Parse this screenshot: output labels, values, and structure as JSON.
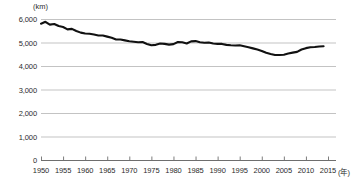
{
  "chart_data": {
    "type": "line",
    "title": "",
    "xlabel": "年",
    "ylabel": "(km)",
    "unit_label": "(km)",
    "x_unit_suffix": "(年)",
    "xlim": [
      1950,
      2015
    ],
    "ylim": [
      0,
      6000
    ],
    "grid": true,
    "grid_axis": "y",
    "legend": "none",
    "line_color": "#111111",
    "grid_color": "#b4b4b4",
    "axis_color": "#6e6e6e",
    "y_ticks": [
      "0",
      "1,000",
      "2,000",
      "3,000",
      "4,000",
      "5,000",
      "6,000"
    ],
    "y_tick_values": [
      0,
      1000,
      2000,
      3000,
      4000,
      5000,
      6000
    ],
    "x_ticks": [
      "1950",
      "1955",
      "1960",
      "1965",
      "1970",
      "1975",
      "1980",
      "1985",
      "1990",
      "1995",
      "2000",
      "2005",
      "2010",
      "2015"
    ],
    "x_tick_values": [
      1950,
      1955,
      1960,
      1965,
      1970,
      1975,
      1980,
      1985,
      1990,
      1995,
      2000,
      2005,
      2010,
      2015
    ],
    "x": [
      1950,
      1951,
      1952,
      1953,
      1954,
      1955,
      1956,
      1957,
      1958,
      1959,
      1960,
      1961,
      1962,
      1963,
      1964,
      1965,
      1966,
      1967,
      1968,
      1969,
      1970,
      1971,
      1972,
      1973,
      1974,
      1975,
      1976,
      1977,
      1978,
      1979,
      1980,
      1981,
      1982,
      1983,
      1984,
      1985,
      1986,
      1987,
      1988,
      1989,
      1990,
      1991,
      1992,
      1993,
      1994,
      1995,
      1996,
      1997,
      1998,
      1999,
      2000,
      2001,
      2002,
      2003,
      2004,
      2005,
      2006,
      2007,
      2008,
      2009,
      2010,
      2011,
      2012,
      2013,
      2014
    ],
    "values": [
      5800,
      5880,
      5760,
      5790,
      5700,
      5660,
      5560,
      5580,
      5490,
      5420,
      5380,
      5370,
      5340,
      5300,
      5300,
      5250,
      5200,
      5130,
      5130,
      5090,
      5050,
      5030,
      5010,
      5020,
      4940,
      4880,
      4900,
      4960,
      4940,
      4910,
      4930,
      5020,
      5010,
      4960,
      5050,
      5060,
      5010,
      4990,
      5000,
      4960,
      4940,
      4940,
      4900,
      4880,
      4870,
      4880,
      4840,
      4800,
      4750,
      4700,
      4640,
      4560,
      4510,
      4470,
      4470,
      4480,
      4530,
      4570,
      4600,
      4700,
      4760,
      4800,
      4810,
      4830,
      4840
    ],
    "series": [
      {
        "name": "距離",
        "values": [
          5800,
          5880,
          5760,
          5790,
          5700,
          5660,
          5560,
          5580,
          5490,
          5420,
          5380,
          5370,
          5340,
          5300,
          5300,
          5250,
          5200,
          5130,
          5130,
          5090,
          5050,
          5030,
          5010,
          5020,
          4940,
          4880,
          4900,
          4960,
          4940,
          4910,
          4930,
          5020,
          5010,
          4960,
          5050,
          5060,
          5010,
          4990,
          5000,
          4960,
          4940,
          4940,
          4900,
          4880,
          4870,
          4880,
          4840,
          4800,
          4750,
          4700,
          4640,
          4560,
          4510,
          4470,
          4470,
          4480,
          4530,
          4570,
          4600,
          4700,
          4760,
          4800,
          4810,
          4830,
          4840
        ]
      }
    ]
  },
  "layout": {
    "plot_left": 41,
    "plot_right": 328,
    "plot_top": 19,
    "plot_bottom": 160
  }
}
